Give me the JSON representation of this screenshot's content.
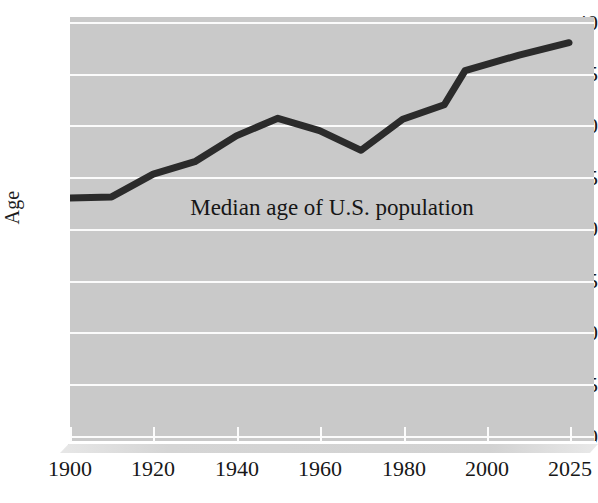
{
  "chart_data": {
    "type": "line",
    "title": "Median age of U.S. population",
    "xlabel": "",
    "ylabel": "Age",
    "x": [
      1900,
      1910,
      1920,
      1930,
      1940,
      1950,
      1960,
      1970,
      1980,
      1990,
      1995,
      2010,
      2025
    ],
    "values": [
      23.0,
      23.1,
      25.3,
      26.5,
      29.0,
      30.7,
      29.5,
      27.6,
      30.6,
      32.0,
      35.3,
      36.8,
      38.0
    ],
    "series": [
      {
        "name": "Median age",
        "color": "#2b2b2b",
        "points": [
          {
            "x": 1900,
            "y": 23.0
          },
          {
            "x": 1910,
            "y": 23.1
          },
          {
            "x": 1920,
            "y": 25.3
          },
          {
            "x": 1930,
            "y": 26.5
          },
          {
            "x": 1940,
            "y": 29.0
          },
          {
            "x": 1950,
            "y": 30.7
          },
          {
            "x": 1960,
            "y": 29.5
          },
          {
            "x": 1970,
            "y": 27.6
          },
          {
            "x": 1980,
            "y": 30.6
          },
          {
            "x": 1990,
            "y": 32.0
          },
          {
            "x": 1995,
            "y": 35.3
          },
          {
            "x": 2010,
            "y": 36.8
          },
          {
            "x": 2025,
            "y": 38.0
          }
        ]
      }
    ],
    "x_tick_labels": [
      "1900",
      "1920",
      "1940",
      "1960",
      "1980",
      "2000",
      "2025"
    ],
    "y_tick_labels": [
      "0",
      "5",
      "10",
      "15",
      "20",
      "25",
      "30",
      "35",
      "40"
    ],
    "ylim": [
      0,
      40
    ],
    "ytick_step": 5,
    "grid": true,
    "grid_color": "#fbfbfb",
    "plot_background": "#c9c9c9",
    "figure_background": "#ffffff",
    "legend": "none",
    "annotations": [
      {
        "text": "Median age of U.S. population",
        "position": "center-plot"
      }
    ]
  }
}
